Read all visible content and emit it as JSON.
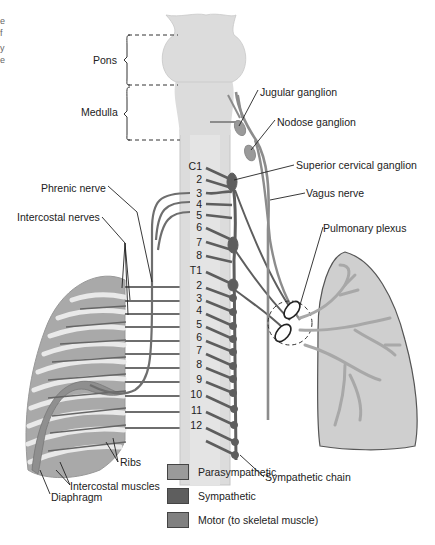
{
  "figure": {
    "edge_text_fragments": [
      "e",
      "f",
      "y",
      "e"
    ],
    "regions": {
      "pons_label": "Pons",
      "medulla_label": "Medulla"
    },
    "labels": {
      "jugular_ganglion": "Jugular ganglion",
      "nodose_ganglion": "Nodose ganglion",
      "superior_cervical_ganglion": "Superior cervical ganglion",
      "vagus_nerve": "Vagus nerve",
      "phrenic_nerve": "Phrenic nerve",
      "intercostal_nerves": "Intercostal nerves",
      "pulmonary_plexus": "Pulmonary plexus",
      "sympathetic_chain": "Sympathetic chain",
      "ribs": "Ribs",
      "intercostal_muscles": "Intercostal muscles",
      "diaphragm": "Diaphragm"
    },
    "cervical_levels": [
      "C1",
      "2",
      "3",
      "4",
      "5",
      "6",
      "7",
      "8"
    ],
    "thoracic_levels": [
      "T1",
      "2",
      "3",
      "4",
      "5",
      "6",
      "7",
      "8",
      "9",
      "10",
      "11",
      "12"
    ]
  },
  "legend": {
    "items": [
      {
        "label": "Parasympathetic",
        "color": "#9a9a9a"
      },
      {
        "label": "Sympathetic",
        "color": "#5e5e5e"
      },
      {
        "label": "Motor (to skeletal muscle)",
        "color": "#808080"
      }
    ]
  },
  "colors": {
    "cord_fill": "#dcdcdc",
    "cord_edge": "#c4c4c4",
    "parasympathetic": "#9a9a9a",
    "sympathetic": "#5e5e5e",
    "motor": "#6e6e6e",
    "lung_fill": "#cfcfcf",
    "chest_wall": "#a9a9a9",
    "rib": "#e8e8e8"
  }
}
